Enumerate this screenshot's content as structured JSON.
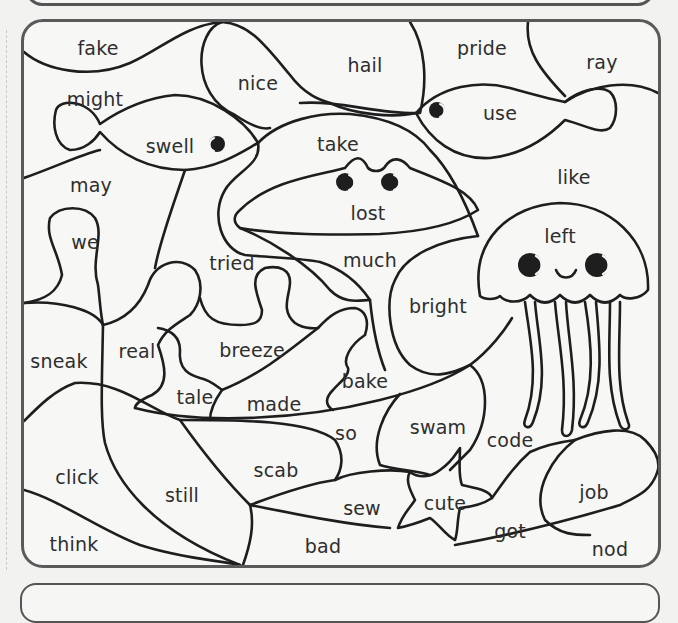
{
  "page": {
    "type": "color-by-word worksheet",
    "theme": "ocean scene"
  },
  "colors": {
    "line": "#1e1e1e",
    "frame": "#5a5a5a",
    "paper": "#f7f7f5",
    "text": "#2e2e2e"
  },
  "words": [
    {
      "id": "fake",
      "label": "fake",
      "x": 98,
      "y": 48
    },
    {
      "id": "nice",
      "label": "nice",
      "x": 258,
      "y": 83
    },
    {
      "id": "hail",
      "label": "hail",
      "x": 365,
      "y": 65
    },
    {
      "id": "pride",
      "label": "pride",
      "x": 482,
      "y": 48
    },
    {
      "id": "ray",
      "label": "ray",
      "x": 602,
      "y": 62
    },
    {
      "id": "might",
      "label": "might",
      "x": 95,
      "y": 99
    },
    {
      "id": "swell",
      "label": "swell",
      "x": 170,
      "y": 146
    },
    {
      "id": "use",
      "label": "use",
      "x": 500,
      "y": 113
    },
    {
      "id": "take",
      "label": "take",
      "x": 338,
      "y": 144
    },
    {
      "id": "may",
      "label": "may",
      "x": 91,
      "y": 185
    },
    {
      "id": "like",
      "label": "like",
      "x": 574,
      "y": 177
    },
    {
      "id": "lost",
      "label": "lost",
      "x": 368,
      "y": 213
    },
    {
      "id": "we",
      "label": "we",
      "x": 85,
      "y": 242
    },
    {
      "id": "left",
      "label": "left",
      "x": 560,
      "y": 236
    },
    {
      "id": "tried",
      "label": "tried",
      "x": 232,
      "y": 263
    },
    {
      "id": "much",
      "label": "much",
      "x": 370,
      "y": 260
    },
    {
      "id": "bright",
      "label": "bright",
      "x": 438,
      "y": 306
    },
    {
      "id": "sneak",
      "label": "sneak",
      "x": 59,
      "y": 361
    },
    {
      "id": "real",
      "label": "real",
      "x": 137,
      "y": 351
    },
    {
      "id": "breeze",
      "label": "breeze",
      "x": 252,
      "y": 350
    },
    {
      "id": "bake",
      "label": "bake",
      "x": 365,
      "y": 381
    },
    {
      "id": "tale",
      "label": "tale",
      "x": 195,
      "y": 397
    },
    {
      "id": "made",
      "label": "made",
      "x": 274,
      "y": 404
    },
    {
      "id": "so",
      "label": "so",
      "x": 346,
      "y": 433
    },
    {
      "id": "swam",
      "label": "swam",
      "x": 438,
      "y": 427
    },
    {
      "id": "code",
      "label": "code",
      "x": 510,
      "y": 440
    },
    {
      "id": "click",
      "label": "click",
      "x": 77,
      "y": 477
    },
    {
      "id": "scab",
      "label": "scab",
      "x": 276,
      "y": 470
    },
    {
      "id": "still",
      "label": "still",
      "x": 182,
      "y": 495
    },
    {
      "id": "sew",
      "label": "sew",
      "x": 362,
      "y": 508
    },
    {
      "id": "cute",
      "label": "cute",
      "x": 445,
      "y": 503
    },
    {
      "id": "job",
      "label": "job",
      "x": 594,
      "y": 492
    },
    {
      "id": "got",
      "label": "got",
      "x": 510,
      "y": 531
    },
    {
      "id": "think",
      "label": "think",
      "x": 74,
      "y": 544
    },
    {
      "id": "bad",
      "label": "bad",
      "x": 323,
      "y": 546
    },
    {
      "id": "nod",
      "label": "nod",
      "x": 610,
      "y": 549
    }
  ]
}
